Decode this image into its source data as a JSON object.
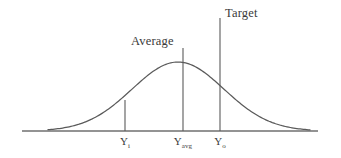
{
  "figure": {
    "type": "distribution-curve-diagram",
    "background_color": "#ffffff",
    "line_color": "#5a5a5a",
    "text_color": "#3a3a3a"
  },
  "annotations": {
    "average": {
      "text": "Average",
      "name": "average-label"
    },
    "target": {
      "text": "Target",
      "name": "target-label"
    }
  },
  "axis": {
    "baseline_name": "horizontal-axis",
    "ticks": [
      {
        "base": "Y",
        "subscript": "i",
        "name": "tick-y-i"
      },
      {
        "base": "Y",
        "subscript": "avg",
        "name": "tick-y-avg"
      },
      {
        "base": "Y",
        "subscript": "o",
        "name": "tick-y-o"
      }
    ]
  },
  "chart_data": {
    "type": "line",
    "title": "",
    "xlabel": "",
    "ylabel": "",
    "grid": false,
    "legend": null,
    "curve": {
      "name": "distribution-curve",
      "shape": "gaussian",
      "peak_x": 178,
      "peak_y_px": 62,
      "baseline_y_px": 131,
      "x_start_px": 48,
      "x_end_px": 310,
      "sigma_px": 46
    },
    "baseline": {
      "x_start_px": 22,
      "x_end_px": 318,
      "y_px": 131
    },
    "vertical_lines": [
      {
        "label": "Y_i",
        "x_px": 125,
        "top_y_px": 100,
        "bottom_y_px": 131,
        "meets_curve": true
      },
      {
        "label": "Y_avg",
        "x_px": 183,
        "top_y_px": 48,
        "bottom_y_px": 131,
        "meets_curve": false
      },
      {
        "label": "Y_o",
        "x_px": 220,
        "top_y_px": 18,
        "bottom_y_px": 131,
        "meets_curve": false
      }
    ],
    "annotations": [
      {
        "text": "Average",
        "x_px": 131,
        "y_px": 35,
        "attached_to": "Y_avg"
      },
      {
        "text": "Target",
        "x_px": 225,
        "y_px": 7,
        "attached_to": "Y_o"
      }
    ]
  }
}
